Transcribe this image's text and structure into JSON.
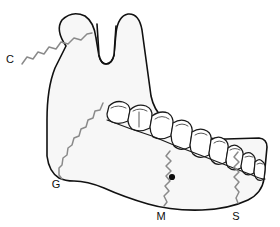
{
  "figure": {
    "name": "mandible-lateral-diagram",
    "background_color": "#ffffff",
    "bone_fill_color": "#f7f7f7",
    "outline_color": "#111111",
    "suture_color": "#8a8a8a",
    "foramen_color": "#0d0d0d"
  },
  "labels": [
    {
      "id": "label-c",
      "text": "C",
      "x": 12,
      "y": 59,
      "points_to": "condylar-neck-suture"
    },
    {
      "id": "label-g",
      "text": "G",
      "x": 56,
      "y": 186,
      "points_to": "gonial-angle-suture"
    },
    {
      "id": "label-m",
      "text": "M",
      "x": 160,
      "y": 218,
      "points_to": "mental-region-suture"
    },
    {
      "id": "label-s",
      "text": "S",
      "x": 235,
      "y": 218,
      "points_to": "symphysis-suture"
    }
  ],
  "landmarks": {
    "mental_foramen": {
      "name": "mental-foramen",
      "cx": 172,
      "cy": 177,
      "r": 3.1
    }
  },
  "sutures": [
    {
      "id": "condylar-neck-suture",
      "label": "C",
      "path": "M 22,64 L 27,57 L 33,59 L 38,52 L 45,54 L 50,47 L 57,48 L 63,42 L 70,43 L 77,38 L 84,39 L 90,35"
    },
    {
      "id": "gonial-angle-suture",
      "label": "G",
      "path": "M 104,104 L 101,111 L 95,112 L 93,119 L 87,121 L 85,128 L 80,130 L 78,137 L 73,139 L 71,146 L 67,149 L 66,156 L 62,159 L 61,166 L 58,169 L 58,176 L 62,180"
    },
    {
      "id": "mental-region-suture",
      "label": "M",
      "path": "M 170,152 L 167,157 L 171,162 L 167,167 L 171,172 L 167,177 L 170,182 L 166,187 L 169,192 L 165,197 L 167,203 L 165,207"
    },
    {
      "id": "symphysis-suture",
      "label": "S",
      "path": "M 238,153 L 235,158 L 239,163 L 235,168 L 239,173 L 235,178 L 239,183 L 236,188 L 239,193 L 237,199 L 238,204"
    }
  ],
  "teeth": [
    {
      "id": "tooth-1",
      "name": "third-molar",
      "path": "M 108,113 L 110,106 Q 116,101 124,103 Q 130,105 130,111 L 128,120 Q 120,124 113,121 Q 108,118 108,113 Z",
      "detail": "M 112,108 Q 119,105 126,108"
    },
    {
      "id": "tooth-2",
      "name": "second-molar",
      "path": "M 128,119 L 130,110 Q 137,104 146,107 Q 152,110 151,117 L 149,127 Q 140,132 132,128 Q 128,124 128,119 Z",
      "detail": "M 133,112 Q 139,108 146,112 M 139,112 L 139,126"
    },
    {
      "id": "tooth-3",
      "name": "first-molar",
      "path": "M 149,126 L 151,116 Q 159,111 167,114 Q 173,117 172,124 L 170,135 Q 161,140 153,136 Q 149,131 149,126 Z",
      "detail": "M 154,119 Q 161,115 168,119"
    },
    {
      "id": "tooth-4",
      "name": "second-premolar",
      "path": "M 170,134 L 172,123 Q 180,119 187,122 Q 192,125 191,132 L 189,145 Q 180,150 173,145 Q 170,140 170,134 Z",
      "detail": "M 175,126 Q 181,123 187,126"
    },
    {
      "id": "tooth-5",
      "name": "first-premolar",
      "path": "M 189,143 L 191,131 Q 199,127 206,130 Q 211,133 210,140 L 208,153 Q 199,158 192,153 Q 189,149 189,143 Z",
      "detail": "M 194,134 Q 200,131 206,134"
    },
    {
      "id": "tooth-6",
      "name": "canine",
      "path": "M 208,151 L 210,139 Q 217,135 223,138 Q 228,141 227,148 L 225,160 Q 217,165 211,160 Q 208,156 208,151 Z",
      "detail": "M 213,142 Q 218,139 224,142"
    },
    {
      "id": "tooth-7",
      "name": "lateral-incisor",
      "path": "M 225,158 L 227,147 Q 233,143 238,146 Q 243,149 242,155 L 240,166 Q 233,170 228,166 Q 225,162 225,158 Z",
      "detail": "M 229,150 Q 234,147 239,150"
    },
    {
      "id": "tooth-8",
      "name": "central-incisor",
      "path": "M 240,164 L 242,154 Q 247,150 251,153 Q 255,156 254,162 L 253,171 Q 247,175 243,171 Q 240,168 240,164 Z",
      "detail": "M 244,156 Q 248,154 252,156"
    },
    {
      "id": "tooth-9",
      "name": "contralateral-incisor",
      "path": "M 253,170 L 254,161 Q 258,157 261,160 Q 265,163 264,169 L 263,177 Q 258,180 255,177 Q 253,174 253,170 Z",
      "detail": "M 256,163 Q 259,161 262,163"
    }
  ],
  "outline": {
    "name": "mandible-outline",
    "path": "M 62,44 Q 57,28 73,22 Q 88,17 93,32 L 97,55 Q 100,66 108,66 Q 117,66 120,55 L 122,34 Q 124,20 133,20 Q 141,21 143,34 L 151,95 Q 154,110 163,119 L 179,130 Q 200,141 230,140 L 262,140 Q 268,141 268,148 L 265,178 Q 263,192 250,199 Q 232,208 205,209 Q 175,210 150,203 Q 125,196 105,187 Q 88,180 74,180 Q 66,180 60,177 Q 50,171 48,155 L 48,120 Q 48,90 54,68 Z"
  }
}
